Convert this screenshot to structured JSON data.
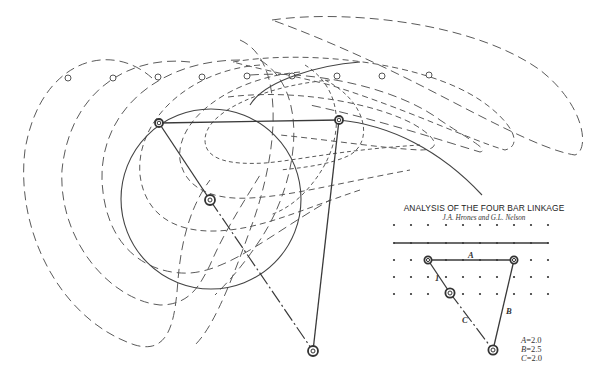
{
  "title": "ANALYSIS OF THE FOUR BAR LINKAGE",
  "authors": "J.A. Hrones and G.L. Nelson",
  "diagram_labels": {
    "link_a": "A",
    "link_b": "B",
    "link_c": "C",
    "crank": "1"
  },
  "legend": [
    {
      "var": "A",
      "text": "=2.0"
    },
    {
      "var": "B",
      "text": "=2.5"
    },
    {
      "var": "C",
      "text": "=2.0"
    }
  ],
  "colors": {
    "background": "#ffffff",
    "ink": "#444444"
  },
  "main_linkage": {
    "joints": {
      "coupler_left": [
        159,
        123
      ],
      "coupler_right": [
        339,
        120
      ],
      "crank_pivot": [
        210,
        200
      ],
      "ground_pivot": [
        313,
        351
      ]
    },
    "crank_circle": {
      "cx": 211,
      "cy": 199,
      "r": 90
    }
  },
  "tracer_points": [
    [
      68,
      78
    ],
    [
      113,
      78
    ],
    [
      158,
      77
    ],
    [
      202,
      77
    ],
    [
      247,
      76
    ],
    [
      292,
      76
    ],
    [
      337,
      76
    ],
    [
      382,
      76
    ],
    [
      429,
      75
    ]
  ],
  "key_diagram": {
    "grid_x": [
      394,
      411,
      428,
      446,
      463,
      480,
      497,
      514,
      531,
      548
    ],
    "grid_y": [
      225,
      243,
      260,
      277,
      294
    ],
    "ground_line_row": 1,
    "joints": {
      "top_left": [
        428,
        260
      ],
      "top_right": [
        514,
        260
      ],
      "crank": [
        450,
        293
      ],
      "bottom": [
        493,
        350
      ]
    }
  }
}
